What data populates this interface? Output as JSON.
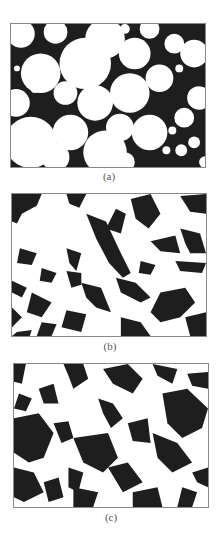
{
  "figure": {
    "panels": [
      {
        "id": "a",
        "caption": "(a)",
        "description": "microstructure with rounded white grains on black matrix"
      },
      {
        "id": "b",
        "caption": "(b)",
        "description": "microstructure with irregular angular black phase, finer distribution"
      },
      {
        "id": "c",
        "caption": "(c)",
        "description": "microstructure with sharp angular shard-like black and white regions"
      }
    ],
    "colors": {
      "phase_dark": "#1e1e1e",
      "phase_light": "#ffffff",
      "frame": "#8a8a8a",
      "caption": "#555555"
    }
  }
}
